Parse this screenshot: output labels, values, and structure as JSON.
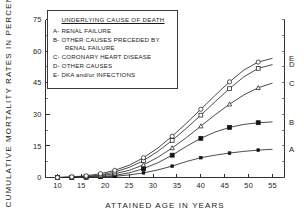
{
  "figure": {
    "legend_title": "UNDERLYING CAUSE OF DEATH",
    "legend_items": [
      {
        "key": "A",
        "label": "A- RENAL FAILURE",
        "cont": ""
      },
      {
        "key": "B",
        "label": "B- OTHER CAUSES PRECEDED BY",
        "cont": "RENAL FAILURE"
      },
      {
        "key": "C",
        "label": "C- CORONARY HEART DISEASE",
        "cont": ""
      },
      {
        "key": "D",
        "label": "D- OTHER CAUSES",
        "cont": ""
      },
      {
        "key": "E",
        "label": "E- DKA and/or INFECTIONS",
        "cont": ""
      }
    ],
    "end_labels": [
      "A",
      "B",
      "C",
      "D",
      "E"
    ]
  },
  "chart_data": {
    "type": "line",
    "title": "",
    "xlabel": "ATTAINED AGE IN YEARS",
    "ylabel": "CUMULATIVE MORTALITY RATES IN PERCENT",
    "xlim": [
      7.5,
      57.5
    ],
    "ylim": [
      0,
      75
    ],
    "xticks": [
      10,
      15,
      20,
      25,
      30,
      35,
      40,
      45,
      50,
      55
    ],
    "xtick_labels": [
      "10",
      "15",
      "20",
      "25",
      "30",
      "35",
      "40",
      "45",
      "50",
      "55"
    ],
    "yticks": [
      0,
      15,
      30,
      45,
      60,
      75
    ],
    "ytick_labels": [
      "0",
      "15",
      "30",
      "45",
      "60",
      "75"
    ],
    "grid": false,
    "legend_position": "upper-left-inset",
    "x": [
      10,
      13,
      16,
      19,
      22,
      25,
      28,
      31,
      34,
      37,
      40,
      43,
      46,
      49,
      52,
      55
    ],
    "series": [
      {
        "name": "A",
        "label": "A- RENAL FAILURE",
        "marker": "filled-small-square",
        "values": [
          0,
          0,
          0,
          0.2,
          0.6,
          1.2,
          2.2,
          3.6,
          5.4,
          7.6,
          9.4,
          10.6,
          11.6,
          12.4,
          13.0,
          13.4
        ]
      },
      {
        "name": "B",
        "label": "B- OTHER CAUSES PRECEDED BY RENAL FAILURE",
        "marker": "filled-square",
        "values": [
          0,
          0,
          0.1,
          0.4,
          1.0,
          2.2,
          4.2,
          7.0,
          10.6,
          14.8,
          18.6,
          21.6,
          23.8,
          25.2,
          26.0,
          26.4
        ]
      },
      {
        "name": "C",
        "label": "C- CORONARY HEART DISEASE",
        "marker": "open-triangle",
        "values": [
          0,
          0.1,
          0.3,
          0.8,
          1.8,
          3.4,
          6.0,
          9.6,
          14.0,
          19.0,
          24.4,
          29.8,
          34.8,
          39.2,
          42.6,
          44.8
        ]
      },
      {
        "name": "D",
        "label": "D- OTHER CAUSES",
        "marker": "open-square",
        "values": [
          0,
          0.2,
          0.5,
          1.2,
          2.6,
          4.8,
          8.0,
          12.4,
          17.6,
          23.4,
          29.6,
          36.0,
          42.2,
          47.8,
          51.8,
          53.6
        ]
      },
      {
        "name": "E",
        "label": "E- DKA and/or INFECTIONS",
        "marker": "open-circle",
        "values": [
          0,
          0.3,
          0.8,
          1.8,
          3.4,
          5.8,
          9.4,
          14.0,
          19.6,
          25.8,
          32.4,
          39.0,
          45.4,
          51.0,
          54.8,
          56.6
        ]
      }
    ]
  }
}
